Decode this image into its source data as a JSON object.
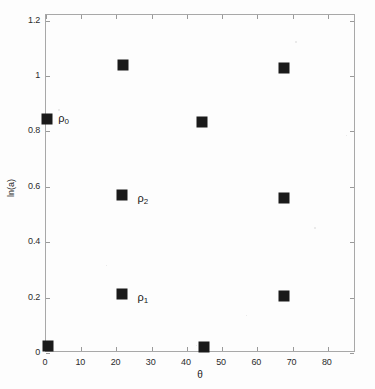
{
  "figure": {
    "background_color": "#fdfdfd",
    "frame_color": "#a8a8a8",
    "marker_color": "#1a1a1a"
  },
  "chart_data": {
    "type": "scatter",
    "title": "",
    "xlabel": "θ",
    "ylabel": "ln(a)",
    "xlim": [
      0,
      88
    ],
    "ylim": [
      0,
      1.22
    ],
    "grid": false,
    "legend": "none",
    "xticks": [
      0,
      10,
      20,
      30,
      40,
      50,
      60,
      70,
      80
    ],
    "xticklabels": [
      "0",
      "10",
      "20",
      "30",
      "40",
      "50",
      "60",
      "70",
      "80"
    ],
    "yticks": [
      0,
      0.2,
      0.4,
      0.6,
      0.8,
      1,
      1.2
    ],
    "yticklabels": [
      "0",
      "0.2",
      "0.4",
      "0.6",
      "0.8",
      "1",
      "1.2"
    ],
    "marker": "filled-square",
    "points": [
      {
        "x": 0.6,
        "y": 0.025,
        "label": ""
      },
      {
        "x": 0.4,
        "y": 0.845,
        "label": "ρ₀"
      },
      {
        "x": 21.8,
        "y": 1.04,
        "label": ""
      },
      {
        "x": 21.6,
        "y": 0.57,
        "label": "ρ₂"
      },
      {
        "x": 21.6,
        "y": 0.213,
        "label": "ρ₁"
      },
      {
        "x": 44.8,
        "y": 0.02,
        "label": ""
      },
      {
        "x": 44.3,
        "y": 0.835,
        "label": ""
      },
      {
        "x": 67.5,
        "y": 1.03,
        "label": ""
      },
      {
        "x": 67.5,
        "y": 0.56,
        "label": ""
      },
      {
        "x": 67.5,
        "y": 0.205,
        "label": ""
      }
    ],
    "annotations": [
      {
        "text": "ρ",
        "sub": "0",
        "x": 3.5,
        "y": 0.845
      },
      {
        "text": "ρ",
        "sub": "2",
        "x": 26.0,
        "y": 0.555
      },
      {
        "text": "ρ",
        "sub": "1",
        "x": 26.0,
        "y": 0.2
      }
    ]
  }
}
